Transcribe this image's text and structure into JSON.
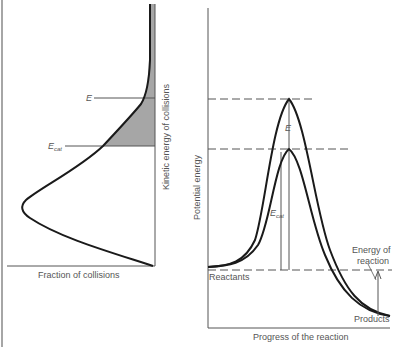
{
  "left_panel": {
    "x_axis_label": "Fraction of collisions",
    "y_axis_label": "Kinetic energy of collisions",
    "line_labels": {
      "E": "E",
      "Ecat_main": "E",
      "Ecat_sub": "cat"
    }
  },
  "right_panel": {
    "x_axis_label": "Progress of the reaction",
    "y_axis_label": "Potential energy",
    "reactants_label": "Reactants",
    "products_label": "Products",
    "energy_of_reaction_line1": "Energy of",
    "energy_of_reaction_line2": "reaction",
    "E_label": "E",
    "Ecat_main": "E",
    "Ecat_sub": "cat"
  },
  "colors": {
    "curve": "#1a1a1a",
    "axis": "#555555",
    "shade": "#a6a6a6",
    "text": "#555555"
  }
}
